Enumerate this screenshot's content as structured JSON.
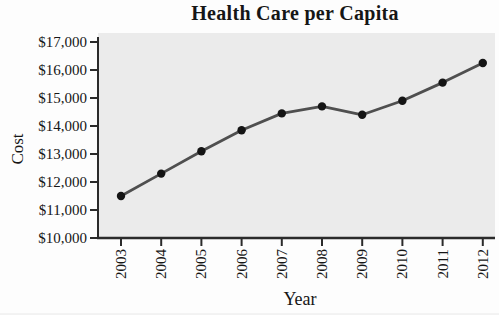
{
  "figure": {
    "title": "Health Care per Capita",
    "ylabel": "Cost",
    "xlabel": "Year"
  },
  "chart_data": {
    "type": "line",
    "title": "Health Care per Capita",
    "xlabel": "Year",
    "ylabel": "Cost",
    "categories": [
      "2003",
      "2004",
      "2005",
      "2006",
      "2007",
      "2008",
      "2009",
      "2010",
      "2011",
      "2012"
    ],
    "values": [
      11500,
      12300,
      13100,
      13850,
      14450,
      14700,
      14400,
      14900,
      15550,
      16250
    ],
    "ylim": [
      10000,
      17000
    ],
    "ytick_interval": 1000,
    "ytick_labels": [
      "$10,000",
      "$11,000",
      "$12,000",
      "$13,000",
      "$14,000",
      "$15,000",
      "$16,000",
      "$17,000"
    ],
    "grid": false,
    "legend": "none",
    "marker": "circle",
    "colors": {
      "line": "#4f4f4f",
      "marker": "#141414",
      "plot_background": "#ebebeb",
      "axis": "#2b2b2b",
      "text": "#161616",
      "page_background": "#fdfdfd"
    }
  }
}
